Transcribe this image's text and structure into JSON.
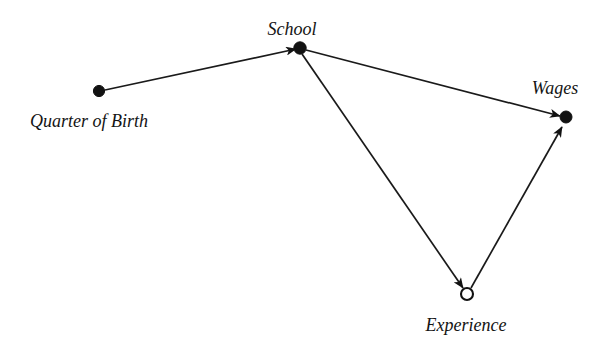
{
  "figure": {
    "type": "causal-diagram",
    "background_color": "#ffffff",
    "ink_color": "#121212",
    "width": 603,
    "height": 349
  },
  "nodes": [
    {
      "id": "quarter_of_birth",
      "label": "Quarter of Birth",
      "marker": "filled-circle",
      "observed": true,
      "x": 99,
      "y": 91,
      "label_x": 30,
      "label_y": 127,
      "label_anchor": "start",
      "label_size": 18
    },
    {
      "id": "school",
      "label": "School",
      "marker": "filled-circle",
      "observed": true,
      "x": 300,
      "y": 48,
      "label_x": 292,
      "label_y": 35,
      "label_anchor": "middle",
      "label_size": 18
    },
    {
      "id": "wages",
      "label": "Wages",
      "marker": "filled-circle",
      "observed": true,
      "x": 566,
      "y": 117,
      "label_x": 555,
      "label_y": 94,
      "label_anchor": "middle",
      "label_size": 18
    },
    {
      "id": "experience",
      "label": "Experience",
      "marker": "hollow-circle",
      "observed": false,
      "x": 467,
      "y": 294,
      "label_x": 466,
      "label_y": 331,
      "label_anchor": "middle",
      "label_size": 18
    }
  ],
  "edges": [
    {
      "id": "qob-to-school",
      "from": "quarter_of_birth",
      "to": "school",
      "from_label": "Quarter of Birth",
      "to_label": "School",
      "x1": 105,
      "y1": 90,
      "x2": 296,
      "y2": 49
    },
    {
      "id": "school-to-wages",
      "from": "school",
      "to": "wages",
      "from_label": "School",
      "to_label": "Wages",
      "x1": 306,
      "y1": 50,
      "x2": 560,
      "y2": 116
    },
    {
      "id": "school-to-experience",
      "from": "school",
      "to": "experience",
      "from_label": "School",
      "to_label": "Experience",
      "x1": 302,
      "y1": 54,
      "x2": 463,
      "y2": 288
    },
    {
      "id": "experience-to-wages",
      "from": "experience",
      "to": "wages",
      "from_label": "Experience",
      "to_label": "Wages",
      "x1": 471,
      "y1": 288,
      "x2": 562,
      "y2": 127
    }
  ]
}
